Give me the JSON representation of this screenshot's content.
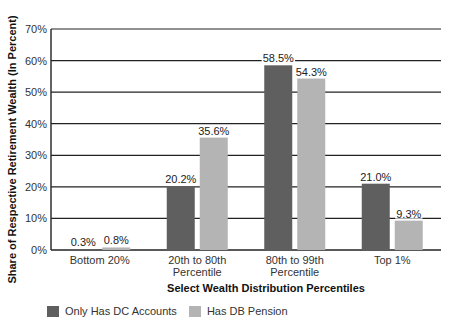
{
  "chart_data": {
    "type": "bar",
    "title": "",
    "xlabel": "Select Wealth Distribution Percentiles",
    "ylabel": "Share of Respective Retirement Wealth (In Percent)",
    "ylim": [
      0,
      70
    ],
    "yticks": [
      "0%",
      "10%",
      "20%",
      "30%",
      "40%",
      "50%",
      "60%",
      "70%"
    ],
    "grid": true,
    "legend_position": "bottom-left",
    "categories": [
      "Bottom 20%",
      "20th to 80th Percentile",
      "80th to 99th Percentile",
      "Top 1%"
    ],
    "category_lines": [
      [
        "Bottom 20%"
      ],
      [
        "20th to 80th",
        "Percentile"
      ],
      [
        "80th to 99th",
        "Percentile"
      ],
      [
        "Top 1%"
      ]
    ],
    "series": [
      {
        "name": "Only Has DC Accounts",
        "color": "#5f5f5f",
        "values": [
          0.3,
          20.2,
          58.5,
          21.0
        ],
        "labels": [
          "0.3%",
          "20.2%",
          "58.5%",
          "21.0%"
        ]
      },
      {
        "name": "Has DB Pension",
        "color": "#b4b4b4",
        "values": [
          0.8,
          35.6,
          54.3,
          9.3
        ],
        "labels": [
          "0.8%",
          "35.6%",
          "54.3%",
          "9.3%"
        ]
      }
    ]
  }
}
